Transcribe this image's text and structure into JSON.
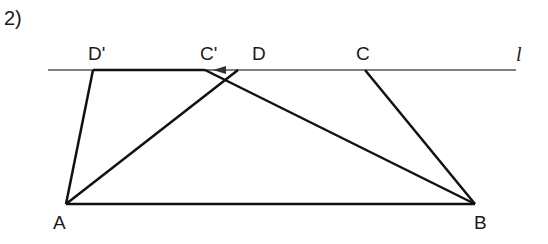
{
  "problem_number": "2)",
  "line_label": "l",
  "points": {
    "D_prime": {
      "label": "D'",
      "x": 93,
      "y": 70
    },
    "C_prime": {
      "label": "C'",
      "x": 205,
      "y": 70
    },
    "D": {
      "label": "D",
      "x": 238,
      "y": 70
    },
    "C": {
      "label": "C",
      "x": 365,
      "y": 70
    },
    "A": {
      "label": "A",
      "x": 66,
      "y": 204
    },
    "B": {
      "label": "B",
      "x": 475,
      "y": 204
    }
  },
  "segments": [
    "D'A",
    "AB",
    "BC",
    "AD",
    "C'B",
    "D'C'"
  ],
  "colors": {
    "line": "#111111",
    "thin_line": "#555555"
  }
}
